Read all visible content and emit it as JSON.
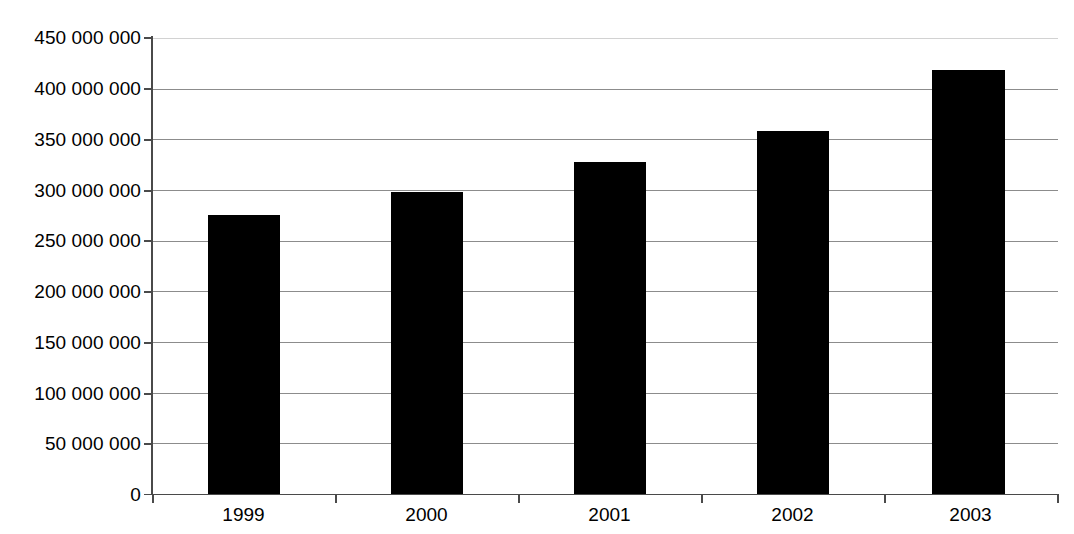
{
  "chart_data": {
    "type": "bar",
    "title": "",
    "subtitle": "",
    "xlabel": "",
    "ylabel": "",
    "categories": [
      "1999",
      "2000",
      "2001",
      "2002",
      "2003"
    ],
    "values": [
      275000000,
      298000000,
      328000000,
      358000000,
      418000000
    ],
    "series": [
      {
        "name": "",
        "values": [
          275000000,
          298000000,
          328000000,
          358000000,
          418000000
        ]
      }
    ],
    "ylim": [
      0,
      450000000
    ],
    "ytick_values": [
      0,
      50000000,
      100000000,
      150000000,
      200000000,
      250000000,
      300000000,
      350000000,
      400000000,
      450000000
    ],
    "ytick_labels": [
      "0",
      "50 000 000",
      "100 000 000",
      "150 000 000",
      "200 000 000",
      "250 000 000",
      "300 000 000",
      "350 000 000",
      "400 000 000",
      "450 000 000"
    ],
    "grid": true,
    "grid_axis": "y",
    "legend": false,
    "legend_position": "none",
    "bar_color": "#000000",
    "gridline_color": "#8c8c8c",
    "axis_color": "#4a4a4a",
    "background_color": "#ffffff",
    "annotations": []
  }
}
